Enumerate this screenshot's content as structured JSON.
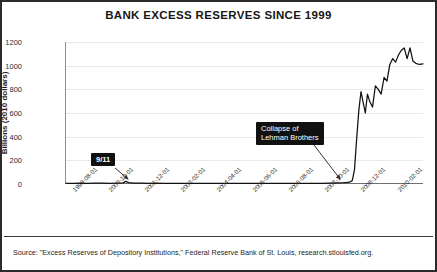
{
  "figure": {
    "title": "BANK EXCESS RESERVES SINCE 1999",
    "source_note": "Source: \"Excess Reserves of Depository Institutions,\" Federal Reserve Bank of St. Louis, research.stlouisfed.org.",
    "border_color": "#2b2b2b",
    "background_color": "#ffffff",
    "line_color": "#111111",
    "gridline_color": "#e9e9e9",
    "annotation_bg_color": "#111111",
    "annotation_text_color": "#ffffff"
  },
  "annotations": [
    {
      "id": "911",
      "text": "9/11"
    },
    {
      "id": "lehman",
      "line1": "Collapse of",
      "line2": "Lehman Brothers"
    }
  ],
  "chart_data": {
    "type": "line",
    "title": "BANK EXCESS RESERVES SINCE 1999",
    "xlabel": "",
    "ylabel": "Billions (2010 dollars)",
    "ylim": [
      0,
      1200
    ],
    "yticks": [
      0,
      200,
      400,
      600,
      800,
      1000,
      1200
    ],
    "grid": true,
    "legend": false,
    "xtick_labels": [
      "1999-08-01",
      "2000-10-01",
      "2001-12-01",
      "2003-02-01",
      "2004-04-01",
      "2005-06-01",
      "2006-08-01",
      "2007-10-01",
      "2008-12-01",
      "2010-02-01"
    ],
    "xtick_positions": [
      0,
      1,
      2,
      3,
      4,
      5,
      6,
      7,
      8,
      9
    ],
    "x_unit": "14 months per tick",
    "annotations": [
      {
        "label": "9/11",
        "x": 1.66,
        "y": 20
      },
      {
        "label": "Collapse of Lehman Brothers",
        "x": 7.75,
        "y": 5
      }
    ],
    "x": [
      0.0,
      0.2,
      0.4,
      0.6,
      0.8,
      1.0,
      1.2,
      1.4,
      1.58,
      1.66,
      1.74,
      1.9,
      2.1,
      2.3,
      2.5,
      2.7,
      2.9,
      3.1,
      3.3,
      3.5,
      3.7,
      3.9,
      4.1,
      4.3,
      4.5,
      4.7,
      4.9,
      5.1,
      5.3,
      5.5,
      5.7,
      5.9,
      6.1,
      6.3,
      6.5,
      6.7,
      6.9,
      7.1,
      7.3,
      7.5,
      7.7,
      7.8,
      7.88,
      7.94,
      8.0,
      8.06,
      8.12,
      8.18,
      8.24,
      8.3,
      8.36,
      8.42,
      8.5,
      8.58,
      8.66,
      8.74,
      8.82,
      8.9,
      8.98,
      9.06,
      9.14,
      9.22,
      9.3,
      9.38,
      9.46,
      9.54,
      9.62,
      9.7,
      9.8,
      9.9
    ],
    "values": [
      6,
      5,
      7,
      6,
      8,
      7,
      6,
      8,
      10,
      22,
      12,
      8,
      7,
      6,
      7,
      6,
      5,
      6,
      5,
      6,
      5,
      6,
      5,
      6,
      5,
      6,
      5,
      6,
      5,
      6,
      5,
      6,
      5,
      6,
      5,
      6,
      5,
      6,
      8,
      10,
      12,
      14,
      18,
      30,
      120,
      380,
      620,
      780,
      690,
      600,
      760,
      700,
      650,
      830,
      800,
      760,
      900,
      870,
      1010,
      1060,
      1030,
      1090,
      1130,
      1150,
      1060,
      1150,
      1040,
      1020,
      1010,
      1015
    ]
  }
}
